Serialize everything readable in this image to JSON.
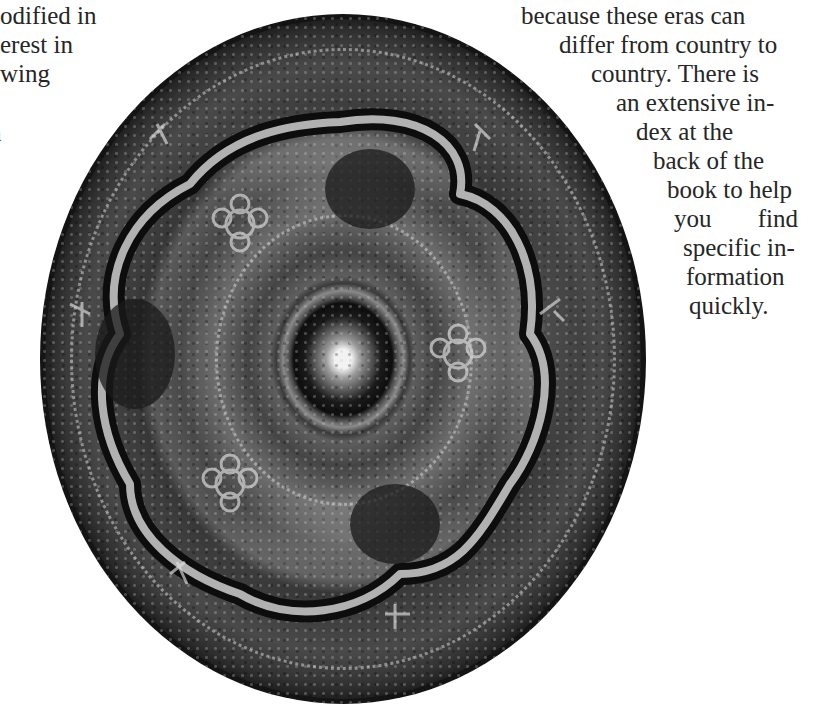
{
  "page": {
    "left_column_fragments": [
      "odified  in",
      "erest in",
      "wing",
      "n"
    ],
    "right_column_lines": [
      "because  these  eras  can",
      "differ from country to",
      "country.  There  is",
      "an extensive in-",
      "dex  at  the",
      "back  of  the",
      "book to help",
      "you  find",
      "specific in-",
      "formation",
      "quickly."
    ]
  },
  "figure": {
    "icon": "photo-disc",
    "colors": {
      "dark": "#141414",
      "mid": "#4a4a4a",
      "highlight": "#e8e8e8"
    }
  }
}
